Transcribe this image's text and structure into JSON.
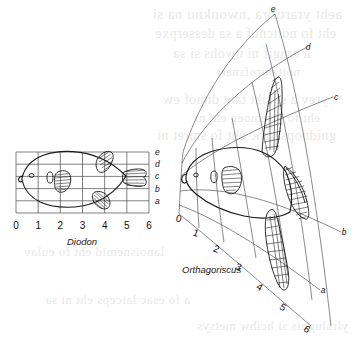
{
  "figure": {
    "type": "transformation-grid-diagram",
    "background_color": "#ffffff",
    "ink_color": "#1a1a1a",
    "grid_color": "#4a4a4a",
    "ghost_text_color": "#e9e9e9"
  },
  "left_panel": {
    "name": "diodon-panel",
    "caption": "Diodon",
    "grid_type": "cartesian",
    "columns": 6,
    "rows": 5,
    "x_axis_labels": [
      "0",
      "1",
      "2",
      "3",
      "4",
      "5",
      "6"
    ],
    "y_axis_labels": [
      "e",
      "d",
      "c",
      "b",
      "a"
    ],
    "features": [
      "body-outline",
      "eye",
      "gill-slit",
      "pectoral-fin",
      "dorsal-fin",
      "anal-fin",
      "caudal-fin"
    ]
  },
  "right_panel": {
    "name": "orthagoriscus-panel",
    "caption": "Orthagoriscus",
    "grid_type": "deformed-fan",
    "columns": 6,
    "rows": 5,
    "x_axis_labels": [
      "0",
      "1",
      "2",
      "3",
      "4",
      "5",
      "6"
    ],
    "y_axis_labels": [
      "e",
      "d",
      "c",
      "b",
      "a"
    ],
    "features": [
      "body-outline",
      "eye",
      "gill-slit",
      "pectoral-fin",
      "dorsal-fin",
      "anal-fin",
      "clavus-tail"
    ]
  },
  "ghost_text": {
    "note": "Faint mirrored show-through text from the reverse side of the printed page; illegible.",
    "lines": [
      "aeht yrartibra ,nwonknu na si",
      "eht fo noitcnuf a sa desserpxe",
      "a erugif ni nwohs si sa",
      "noitamrofsnart",
      "yrev a si siht taht dnuof ew",
      "eht fo yrtemoeg eht ni",
      "gnidnopserroc eht fo smret ni",
      "lanoisnemid eht fo eulav",
      "a fo esac laiceps eht ni sa",
      "ylralugnis si hcihw metsys"
    ]
  }
}
